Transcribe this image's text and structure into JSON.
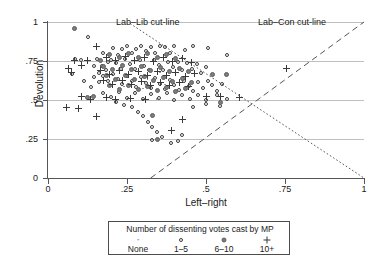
{
  "chart_data": {
    "type": "scatter",
    "title": "",
    "xlabel": "Left–right",
    "ylabel": "Devolution",
    "xlim": [
      0,
      1
    ],
    "ylim": [
      0,
      1
    ],
    "xticks": [
      "0",
      ".25",
      ".5",
      ".75",
      "1"
    ],
    "yticks": [
      "0",
      ".25",
      ".5",
      ".75",
      "1"
    ],
    "xtick_values": [
      0,
      0.25,
      0.5,
      0.75,
      1
    ],
    "ytick_values": [
      0,
      0.25,
      0.5,
      0.75,
      1
    ],
    "grid": "horizontal",
    "legend_position": "below-plot",
    "legend_title": "Number of dissenting votes cast by MP",
    "legend_entries": [
      {
        "label": "None",
        "marker": "dot",
        "glyph": "·"
      },
      {
        "label": "1–5",
        "marker": "open-circle",
        "glyph": "○"
      },
      {
        "label": "6–10",
        "marker": "filled-circle",
        "glyph": "●"
      },
      {
        "label": "10+",
        "marker": "plus",
        "glyph": "+"
      }
    ],
    "annotations": [
      {
        "name": "lab-lib-cutline",
        "text": "Lab–Lib cut-line",
        "line_style": "dotted",
        "x1": 0.26,
        "y1": 0.99,
        "x2": 1.0,
        "y2": 0.0
      },
      {
        "name": "lab-con-cutline",
        "text": "Lab–Con cut-line",
        "line_style": "dashed",
        "x1": 0.325,
        "y1": 0.0,
        "x2": 1.0,
        "y2": 1.0
      }
    ],
    "series": [
      {
        "name": "None",
        "marker": "dot",
        "points": [
          [
            0.3,
            0.575
          ],
          [
            0.345,
            0.505
          ],
          [
            0.255,
            0.66
          ],
          [
            0.4,
            0.545
          ],
          [
            0.225,
            0.7
          ],
          [
            0.315,
            0.635
          ],
          [
            0.37,
            0.6
          ],
          [
            0.275,
            0.555
          ],
          [
            0.205,
            0.62
          ],
          [
            0.355,
            0.675
          ],
          [
            0.29,
            0.72
          ],
          [
            0.24,
            0.585
          ]
        ]
      },
      {
        "name": "1–5",
        "marker": "open-circle",
        "points": [
          [
            0.125,
            0.905
          ],
          [
            0.075,
            0.665
          ],
          [
            0.105,
            0.755
          ],
          [
            0.085,
            0.76
          ],
          [
            0.145,
            0.715
          ],
          [
            0.115,
            0.62
          ],
          [
            0.16,
            0.675
          ],
          [
            0.135,
            0.585
          ],
          [
            0.175,
            0.8
          ],
          [
            0.19,
            0.745
          ],
          [
            0.205,
            0.835
          ],
          [
            0.22,
            0.79
          ],
          [
            0.235,
            0.825
          ],
          [
            0.25,
            0.845
          ],
          [
            0.265,
            0.8
          ],
          [
            0.28,
            0.83
          ],
          [
            0.295,
            0.845
          ],
          [
            0.31,
            0.815
          ],
          [
            0.325,
            0.84
          ],
          [
            0.34,
            0.8
          ],
          [
            0.355,
            0.845
          ],
          [
            0.37,
            0.84
          ],
          [
            0.385,
            0.8
          ],
          [
            0.4,
            0.845
          ],
          [
            0.435,
            0.82
          ],
          [
            0.46,
            0.845
          ],
          [
            0.505,
            0.835
          ],
          [
            0.565,
            0.79
          ],
          [
            0.155,
            0.765
          ],
          [
            0.17,
            0.72
          ],
          [
            0.185,
            0.69
          ],
          [
            0.2,
            0.755
          ],
          [
            0.215,
            0.735
          ],
          [
            0.23,
            0.7
          ],
          [
            0.245,
            0.765
          ],
          [
            0.26,
            0.73
          ],
          [
            0.275,
            0.7
          ],
          [
            0.29,
            0.755
          ],
          [
            0.305,
            0.72
          ],
          [
            0.32,
            0.69
          ],
          [
            0.335,
            0.755
          ],
          [
            0.35,
            0.725
          ],
          [
            0.365,
            0.695
          ],
          [
            0.38,
            0.745
          ],
          [
            0.395,
            0.71
          ],
          [
            0.41,
            0.745
          ],
          [
            0.425,
            0.69
          ],
          [
            0.44,
            0.735
          ],
          [
            0.455,
            0.7
          ],
          [
            0.47,
            0.73
          ],
          [
            0.485,
            0.675
          ],
          [
            0.5,
            0.71
          ],
          [
            0.145,
            0.645
          ],
          [
            0.16,
            0.615
          ],
          [
            0.175,
            0.655
          ],
          [
            0.19,
            0.625
          ],
          [
            0.205,
            0.665
          ],
          [
            0.22,
            0.635
          ],
          [
            0.235,
            0.6
          ],
          [
            0.25,
            0.655
          ],
          [
            0.265,
            0.62
          ],
          [
            0.28,
            0.585
          ],
          [
            0.295,
            0.645
          ],
          [
            0.31,
            0.61
          ],
          [
            0.325,
            0.575
          ],
          [
            0.34,
            0.64
          ],
          [
            0.355,
            0.605
          ],
          [
            0.37,
            0.57
          ],
          [
            0.385,
            0.63
          ],
          [
            0.4,
            0.595
          ],
          [
            0.415,
            0.565
          ],
          [
            0.43,
            0.625
          ],
          [
            0.445,
            0.59
          ],
          [
            0.46,
            0.555
          ],
          [
            0.475,
            0.615
          ],
          [
            0.49,
            0.58
          ],
          [
            0.505,
            0.625
          ],
          [
            0.52,
            0.595
          ],
          [
            0.535,
            0.56
          ],
          [
            0.55,
            0.6
          ],
          [
            0.175,
            0.545
          ],
          [
            0.2,
            0.52
          ],
          [
            0.225,
            0.55
          ],
          [
            0.25,
            0.515
          ],
          [
            0.275,
            0.545
          ],
          [
            0.3,
            0.505
          ],
          [
            0.325,
            0.54
          ],
          [
            0.35,
            0.51
          ],
          [
            0.375,
            0.545
          ],
          [
            0.4,
            0.5
          ],
          [
            0.425,
            0.535
          ],
          [
            0.45,
            0.505
          ],
          [
            0.475,
            0.535
          ],
          [
            0.5,
            0.5
          ],
          [
            0.535,
            0.53
          ],
          [
            0.565,
            0.505
          ],
          [
            0.265,
            0.455
          ],
          [
            0.285,
            0.425
          ],
          [
            0.3,
            0.395
          ],
          [
            0.315,
            0.36
          ],
          [
            0.33,
            0.325
          ],
          [
            0.345,
            0.295
          ],
          [
            0.36,
            0.265
          ],
          [
            0.39,
            0.225
          ],
          [
            0.41,
            0.235
          ],
          [
            0.215,
            0.485
          ],
          [
            0.24,
            0.47
          ],
          [
            0.46,
            0.455
          ],
          [
            0.5,
            0.475
          ],
          [
            0.545,
            0.46
          ],
          [
            0.33,
            0.245
          ],
          [
            0.425,
            0.275
          ]
        ]
      },
      {
        "name": "6–10",
        "marker": "filled-circle",
        "points": [
          [
            0.085,
            0.96
          ],
          [
            0.165,
            0.755
          ],
          [
            0.195,
            0.79
          ],
          [
            0.225,
            0.77
          ],
          [
            0.255,
            0.8
          ],
          [
            0.285,
            0.775
          ],
          [
            0.315,
            0.795
          ],
          [
            0.345,
            0.77
          ],
          [
            0.375,
            0.79
          ],
          [
            0.405,
            0.765
          ],
          [
            0.175,
            0.715
          ],
          [
            0.205,
            0.695
          ],
          [
            0.235,
            0.72
          ],
          [
            0.265,
            0.695
          ],
          [
            0.295,
            0.715
          ],
          [
            0.325,
            0.69
          ],
          [
            0.355,
            0.71
          ],
          [
            0.385,
            0.685
          ],
          [
            0.415,
            0.705
          ],
          [
            0.445,
            0.68
          ],
          [
            0.185,
            0.655
          ],
          [
            0.215,
            0.63
          ],
          [
            0.245,
            0.655
          ],
          [
            0.275,
            0.63
          ],
          [
            0.305,
            0.65
          ],
          [
            0.335,
            0.625
          ],
          [
            0.365,
            0.645
          ],
          [
            0.395,
            0.62
          ],
          [
            0.425,
            0.64
          ],
          [
            0.455,
            0.615
          ],
          [
            0.195,
            0.59
          ],
          [
            0.225,
            0.565
          ],
          [
            0.255,
            0.59
          ],
          [
            0.285,
            0.565
          ],
          [
            0.315,
            0.585
          ],
          [
            0.345,
            0.56
          ],
          [
            0.375,
            0.58
          ],
          [
            0.405,
            0.555
          ],
          [
            0.435,
            0.575
          ],
          [
            0.125,
            0.515
          ],
          [
            0.145,
            0.52
          ],
          [
            0.33,
            0.4
          ],
          [
            0.52,
            0.665
          ],
          [
            0.565,
            0.665
          ],
          [
            0.545,
            0.485
          ],
          [
            0.345,
            0.245
          ]
        ]
      },
      {
        "name": "10+",
        "marker": "plus",
        "points": [
          [
            0.085,
            0.755
          ],
          [
            0.065,
            0.7
          ],
          [
            0.075,
            0.675
          ],
          [
            0.155,
            0.845
          ],
          [
            0.125,
            0.755
          ],
          [
            0.105,
            0.72
          ],
          [
            0.185,
            0.775
          ],
          [
            0.215,
            0.755
          ],
          [
            0.245,
            0.78
          ],
          [
            0.275,
            0.755
          ],
          [
            0.305,
            0.775
          ],
          [
            0.335,
            0.75
          ],
          [
            0.365,
            0.77
          ],
          [
            0.395,
            0.745
          ],
          [
            0.425,
            0.765
          ],
          [
            0.455,
            0.74
          ],
          [
            0.165,
            0.69
          ],
          [
            0.195,
            0.665
          ],
          [
            0.225,
            0.69
          ],
          [
            0.255,
            0.665
          ],
          [
            0.285,
            0.685
          ],
          [
            0.315,
            0.66
          ],
          [
            0.345,
            0.68
          ],
          [
            0.375,
            0.655
          ],
          [
            0.405,
            0.675
          ],
          [
            0.435,
            0.65
          ],
          [
            0.465,
            0.67
          ],
          [
            0.175,
            0.625
          ],
          [
            0.205,
            0.6
          ],
          [
            0.235,
            0.625
          ],
          [
            0.265,
            0.6
          ],
          [
            0.295,
            0.62
          ],
          [
            0.325,
            0.595
          ],
          [
            0.355,
            0.615
          ],
          [
            0.385,
            0.59
          ],
          [
            0.415,
            0.61
          ],
          [
            0.445,
            0.585
          ],
          [
            0.105,
            0.52
          ],
          [
            0.135,
            0.505
          ],
          [
            0.185,
            0.515
          ],
          [
            0.215,
            0.505
          ],
          [
            0.26,
            0.51
          ],
          [
            0.31,
            0.505
          ],
          [
            0.06,
            0.455
          ],
          [
            0.095,
            0.445
          ],
          [
            0.155,
            0.395
          ],
          [
            0.39,
            0.305
          ],
          [
            0.425,
            0.375
          ],
          [
            0.5,
            0.525
          ],
          [
            0.545,
            0.52
          ],
          [
            0.755,
            0.705
          ],
          [
            0.605,
            0.515
          ]
        ]
      }
    ]
  },
  "caption": ""
}
